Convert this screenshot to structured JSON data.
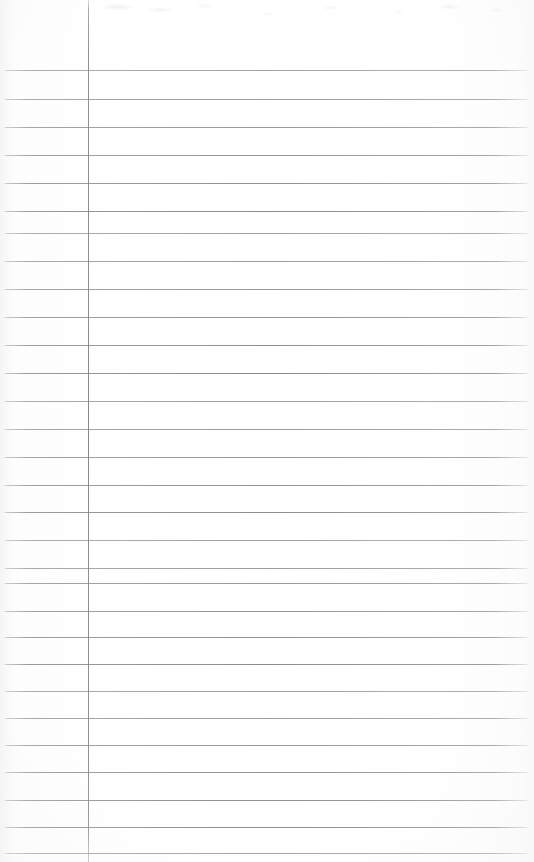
{
  "document": {
    "kind": "scanned-ruled-notebook-page",
    "title": "Blank lined notepad page (scan)",
    "page_width": 534,
    "page_height": 862,
    "background_color": "#fdfdfd",
    "rule_color": "#8a8a93",
    "margin_rule_color": "#82828c",
    "text_content": "",
    "has_handwriting": false,
    "has_printed_text": false
  },
  "ruling": {
    "line_count": 28,
    "first_line_y": 70,
    "line_spacing": 28.3,
    "line_left_x": 3,
    "line_right_x": 530,
    "line_thickness": 1,
    "line_y_positions": [
      70,
      99,
      127,
      155,
      183,
      211,
      233,
      261,
      289,
      317,
      345,
      373,
      401,
      429,
      457,
      485,
      512,
      540,
      568,
      583,
      611,
      637,
      664,
      691,
      718,
      745,
      772,
      800,
      827,
      853
    ]
  },
  "margin": {
    "name": "vertical-margin-rule",
    "x": 88,
    "top_y": 0,
    "bottom_y": 862,
    "thickness": 1
  },
  "annotations": {
    "none_label": "",
    "empty_state": ""
  }
}
